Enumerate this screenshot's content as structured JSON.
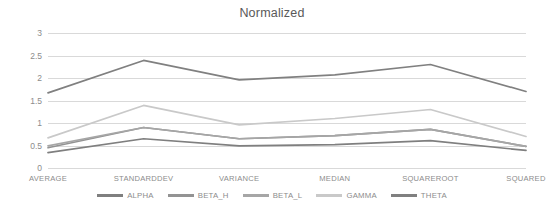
{
  "chart_data": {
    "type": "line",
    "title": "Normalized",
    "xlabel": "",
    "ylabel": "",
    "categories": [
      "AVERAGE",
      "STANDARDDEV",
      "VARIANCE",
      "MEDIAN",
      "SQUAREROOT",
      "SQUARED"
    ],
    "ylim": [
      0,
      3
    ],
    "yticks": [
      0,
      0.5,
      1,
      1.5,
      2,
      2.5,
      3
    ],
    "ytick_labels": [
      "0",
      "0.5",
      "1",
      "1.5",
      "2",
      "2.5",
      "3"
    ],
    "grid": true,
    "legend_position": "bottom",
    "series": [
      {
        "name": "ALPHA",
        "color": "#7f7f7f",
        "values": [
          0.34,
          0.65,
          0.49,
          0.52,
          0.61,
          0.39
        ]
      },
      {
        "name": "BETA_H",
        "color": "#939393",
        "values": [
          0.45,
          0.9,
          0.65,
          0.72,
          0.86,
          0.48
        ]
      },
      {
        "name": "BETA_L",
        "color": "#a6a6a6",
        "values": [
          0.49,
          0.9,
          0.65,
          0.72,
          0.86,
          0.48
        ]
      },
      {
        "name": "GAMMA",
        "color": "#c9c9c9",
        "values": [
          0.67,
          1.39,
          0.96,
          1.1,
          1.3,
          0.7
        ]
      },
      {
        "name": "THETA",
        "color": "#808080",
        "values": [
          1.67,
          2.39,
          1.96,
          2.07,
          2.3,
          1.7
        ]
      }
    ]
  },
  "colors": {
    "gridline": "#d9d9d9",
    "tick_text": "#8c8c8c",
    "title_text": "#595959",
    "background": "#ffffff"
  }
}
